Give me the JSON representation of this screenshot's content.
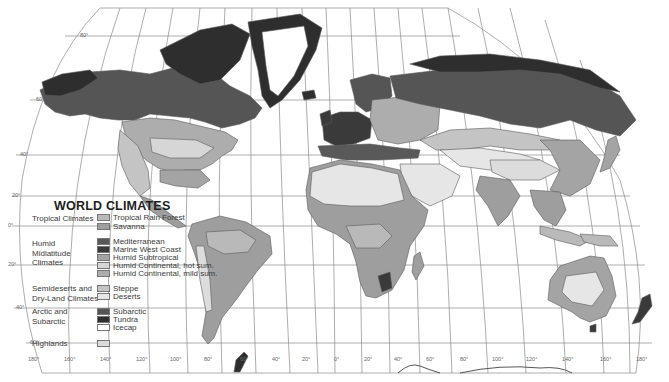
{
  "map": {
    "title": "WORLD CLIMATES",
    "projection": "interrupted world projection with graticule",
    "colors": {
      "ocean": "#ffffff",
      "graticule": "#8a8a8a",
      "border": "#6a6a6a"
    },
    "latitude_labels": [
      "80°",
      "60°",
      "40°",
      "20°",
      "0°",
      "20°",
      "40°",
      "60°"
    ],
    "longitude_labels": [
      "180°",
      "160°",
      "140°",
      "120°",
      "100°",
      "80°",
      "60°",
      "40°",
      "20°",
      "0°",
      "20°",
      "40°",
      "60°",
      "80°",
      "100°",
      "120°",
      "140°",
      "160°",
      "180°"
    ]
  },
  "legend": {
    "title": "WORLD CLIMATES",
    "groups": [
      {
        "label": "Tropical Climates",
        "items": [
          {
            "label": "Tropical Rain Forest",
            "color": "#b9b9b9"
          },
          {
            "label": "Savanna",
            "color": "#9e9e9e"
          }
        ]
      },
      {
        "label": "Humid Midlatitude Climates",
        "label_lines": [
          "Humid",
          "Midlatitude",
          "Climates"
        ],
        "items": [
          {
            "label": "Mediterranean",
            "color": "#595959"
          },
          {
            "label": "Marine West Coast",
            "color": "#3a3a3a"
          },
          {
            "label": "Humid Subtropical",
            "color": "#a4a4a4"
          },
          {
            "label": "Humid Continental, hot sum.",
            "color": "#d6d6d6"
          },
          {
            "label": "Humid Continental, mild sum.",
            "color": "#adadad"
          }
        ]
      },
      {
        "label": "Semideserts and Dry-Land Climates",
        "label_lines": [
          "Semideserts and",
          "Dry-Land Climates"
        ],
        "items": [
          {
            "label": "Steppe",
            "color": "#c4c4c4"
          },
          {
            "label": "Deserts",
            "color": "#e6e6e6"
          }
        ]
      },
      {
        "label": "Arctic and Subarctic",
        "label_lines": [
          "Arctic and",
          "Subarctic"
        ],
        "items": [
          {
            "label": "Subarctic",
            "color": "#555555"
          },
          {
            "label": "Tundra",
            "color": "#2e2e2e"
          },
          {
            "label": "Icecap",
            "color": "#ffffff"
          }
        ]
      },
      {
        "label": "Highlands",
        "items": [
          {
            "label": "",
            "color": "#dcdcdc"
          }
        ]
      }
    ]
  }
}
